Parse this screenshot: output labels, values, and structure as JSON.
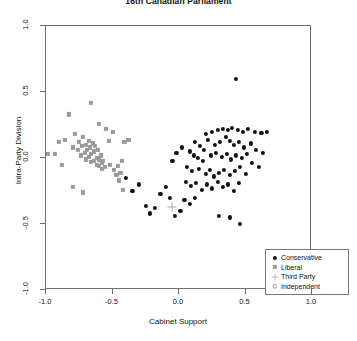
{
  "chart_data": {
    "type": "scatter",
    "title": "16th Canadian Parliament",
    "xlabel": "Cabinet Support",
    "ylabel": "Intra-Party Division",
    "xlim": [
      -1.0,
      1.0
    ],
    "ylim": [
      -1.0,
      1.0
    ],
    "xticks": [
      "-1.0",
      "-0.5",
      "0.0",
      "0.5",
      "1.0"
    ],
    "xtick_values": [
      -1.0,
      -0.5,
      0.0,
      0.5,
      1.0
    ],
    "yticks": [
      "1.0",
      "0.5",
      "0.0",
      "-0.5",
      "-1.0"
    ],
    "ytick_values": [
      1.0,
      0.5,
      0.0,
      -0.5,
      -1.0
    ],
    "grid": false,
    "legend_position": "bottom-right",
    "legend": [
      {
        "label": "Conservative",
        "marker": "filled-circle",
        "color": "#111111"
      },
      {
        "label": "Liberal",
        "marker": "filled-square",
        "color": "#9a9a9a"
      },
      {
        "label": "Third Party",
        "marker": "plus",
        "color": "#a6a6a6"
      },
      {
        "label": "Independent",
        "marker": "open-circle",
        "color": "#a0a0a0"
      }
    ],
    "series": [
      {
        "name": "Conservative",
        "marker": "filled-circle",
        "color": "#111111",
        "points": [
          [
            0.43,
            0.6
          ],
          [
            0.2,
            0.18
          ],
          [
            0.25,
            0.2
          ],
          [
            0.29,
            0.21
          ],
          [
            0.33,
            0.22
          ],
          [
            0.37,
            0.21
          ],
          [
            0.4,
            0.23
          ],
          [
            0.44,
            0.21
          ],
          [
            0.48,
            0.2
          ],
          [
            0.52,
            0.22
          ],
          [
            0.57,
            0.2
          ],
          [
            0.62,
            0.19
          ],
          [
            0.66,
            0.2
          ],
          [
            0.12,
            0.12
          ],
          [
            0.16,
            0.09
          ],
          [
            0.19,
            0.06
          ],
          [
            0.22,
            0.14
          ],
          [
            0.27,
            0.1
          ],
          [
            0.31,
            0.12
          ],
          [
            0.35,
            0.16
          ],
          [
            0.38,
            0.13
          ],
          [
            0.41,
            0.1
          ],
          [
            0.45,
            0.12
          ],
          [
            0.49,
            0.08
          ],
          [
            0.54,
            0.11
          ],
          [
            0.08,
            0.05
          ],
          [
            0.11,
            0.02
          ],
          [
            0.14,
            0.0
          ],
          [
            0.18,
            -0.02
          ],
          [
            0.24,
            0.02
          ],
          [
            0.28,
            0.04
          ],
          [
            0.32,
            0.01
          ],
          [
            0.36,
            0.03
          ],
          [
            0.39,
            -0.01
          ],
          [
            0.43,
            0.02
          ],
          [
            0.47,
            0.0
          ],
          [
            0.51,
            0.03
          ],
          [
            0.06,
            -0.07
          ],
          [
            0.1,
            -0.1
          ],
          [
            0.15,
            -0.08
          ],
          [
            0.2,
            -0.12
          ],
          [
            0.23,
            -0.09
          ],
          [
            0.26,
            -0.14
          ],
          [
            0.3,
            -0.11
          ],
          [
            0.34,
            -0.09
          ],
          [
            0.38,
            -0.13
          ],
          [
            0.42,
            -0.1
          ],
          [
            0.46,
            -0.07
          ],
          [
            0.5,
            -0.12
          ],
          [
            0.05,
            -0.18
          ],
          [
            0.09,
            -0.21
          ],
          [
            0.13,
            -0.19
          ],
          [
            0.17,
            -0.24
          ],
          [
            0.21,
            -0.2
          ],
          [
            0.25,
            -0.23
          ],
          [
            0.29,
            -0.18
          ],
          [
            0.33,
            -0.22
          ],
          [
            0.37,
            -0.2
          ],
          [
            0.41,
            -0.25
          ],
          [
            0.45,
            -0.19
          ],
          [
            0.58,
            0.06
          ],
          [
            0.63,
            0.04
          ],
          [
            0.55,
            -0.04
          ],
          [
            0.6,
            -0.07
          ],
          [
            0.02,
            0.08
          ],
          [
            -0.02,
            0.04
          ],
          [
            -0.05,
            -0.02
          ],
          [
            -0.1,
            -0.22
          ],
          [
            -0.14,
            -0.27
          ],
          [
            -0.07,
            -0.3
          ],
          [
            0.04,
            -0.32
          ],
          [
            0.08,
            -0.35
          ],
          [
            0.12,
            -0.3
          ],
          [
            -0.18,
            -0.38
          ],
          [
            -0.22,
            -0.42
          ],
          [
            -0.25,
            -0.36
          ],
          [
            0.3,
            -0.44
          ],
          [
            0.38,
            -0.45
          ],
          [
            0.46,
            -0.5
          ],
          [
            -0.3,
            -0.2
          ],
          [
            -0.35,
            -0.25
          ],
          [
            -0.4,
            -0.15
          ],
          [
            0.01,
            -0.4
          ],
          [
            -0.03,
            -0.44
          ]
        ]
      },
      {
        "name": "Liberal",
        "marker": "filled-square",
        "color": "#9a9a9a",
        "points": [
          [
            -0.99,
            0.03
          ],
          [
            -0.93,
            0.03
          ],
          [
            -0.86,
            0.14
          ],
          [
            -0.83,
            0.33
          ],
          [
            -0.8,
            0.08
          ],
          [
            -0.78,
            0.18
          ],
          [
            -0.76,
            0.06
          ],
          [
            -0.75,
            0.12
          ],
          [
            -0.74,
            0.02
          ],
          [
            -0.73,
            0.09
          ],
          [
            -0.72,
            0.16
          ],
          [
            -0.71,
            0.04
          ],
          [
            -0.7,
            0.1
          ],
          [
            -0.7,
            -0.01
          ],
          [
            -0.69,
            0.06
          ],
          [
            -0.68,
            0.13
          ],
          [
            -0.68,
            0.01
          ],
          [
            -0.67,
            0.08
          ],
          [
            -0.66,
            0.03
          ],
          [
            -0.66,
            -0.03
          ],
          [
            -0.65,
            0.11
          ],
          [
            -0.64,
            0.05
          ],
          [
            -0.64,
            -0.02
          ],
          [
            -0.63,
            0.09
          ],
          [
            -0.62,
            0.0
          ],
          [
            -0.62,
            -0.05
          ],
          [
            -0.61,
            0.06
          ],
          [
            -0.6,
            -0.01
          ],
          [
            -0.6,
            -0.06
          ],
          [
            -0.59,
            0.02
          ],
          [
            -0.58,
            -0.04
          ],
          [
            -0.58,
            -0.08
          ],
          [
            -0.57,
            -0.02
          ],
          [
            -0.56,
            -0.07
          ],
          [
            -0.66,
            0.42
          ],
          [
            -0.6,
            0.26
          ],
          [
            -0.53,
            0.13
          ],
          [
            -0.5,
            0.2
          ],
          [
            -0.52,
            -0.05
          ],
          [
            -0.49,
            -0.09
          ],
          [
            -0.47,
            -0.13
          ],
          [
            -0.46,
            -0.06
          ],
          [
            -0.44,
            -0.11
          ],
          [
            -0.45,
            -0.17
          ],
          [
            -0.43,
            -0.02
          ],
          [
            -0.41,
            0.12
          ],
          [
            -0.88,
            -0.05
          ],
          [
            -0.9,
            0.12
          ],
          [
            -0.8,
            -0.22
          ],
          [
            -0.72,
            -0.26
          ],
          [
            -0.55,
            0.22
          ],
          [
            -0.42,
            -0.24
          ],
          [
            -0.38,
            0.14
          ]
        ]
      },
      {
        "name": "Third Party",
        "marker": "plus",
        "color": "#a6a6a6",
        "points": [
          [
            -0.05,
            -0.37
          ]
        ]
      },
      {
        "name": "Independent",
        "marker": "open-circle",
        "color": "#a0a0a0",
        "points": []
      }
    ]
  }
}
